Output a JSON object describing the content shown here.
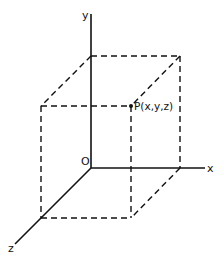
{
  "diagram": {
    "type": "3d-coordinate-box",
    "labels": {
      "x_axis": "x",
      "y_axis": "y",
      "z_axis": "z",
      "origin": "O",
      "point": "P(x,y,z)"
    },
    "colors": {
      "line": "#111111",
      "background": "#ffffff"
    }
  }
}
